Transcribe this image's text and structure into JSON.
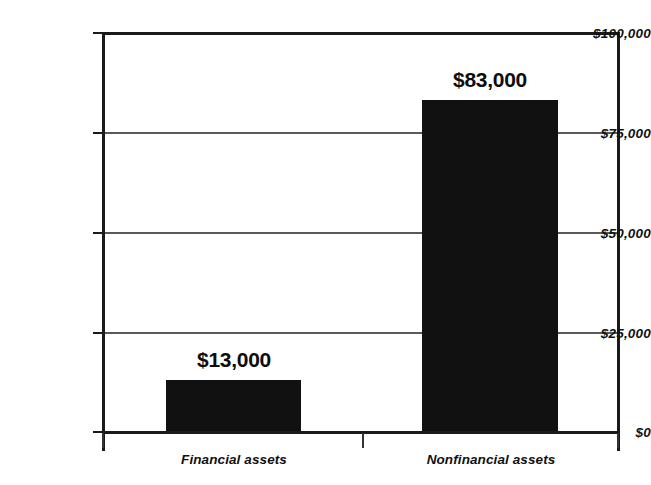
{
  "chart_data": {
    "type": "bar",
    "title": "",
    "subtitle": "",
    "xlabel": "",
    "ylabel": "",
    "categories": [
      "Financial assets",
      "Nonfinancial assets"
    ],
    "values": [
      13000,
      83000
    ],
    "value_labels": [
      "$13,000",
      "$83,000"
    ],
    "ylim": [
      0,
      100000
    ],
    "ytick_values": [
      0,
      25000,
      50000,
      75000,
      100000
    ],
    "ytick_labels": [
      "$0",
      "$25,000",
      "$50,000",
      "$75,000",
      "$100,000"
    ],
    "grid": true,
    "grid_axis": "y",
    "legend": false,
    "legend_position": "none",
    "bar_color": "#111111",
    "gridline_color": "#5a5a5a",
    "axis_color": "#1a1a1a",
    "background_color": "#ffffff",
    "annotations": []
  },
  "axis": {
    "y": {
      "ticks": [
        {
          "label": "$100,000",
          "value": 100000
        },
        {
          "label": "$75,000",
          "value": 75000
        },
        {
          "label": "$50,000",
          "value": 50000
        },
        {
          "label": "$25,000",
          "value": 25000
        },
        {
          "label": "$0",
          "value": 0
        }
      ]
    },
    "x": {
      "ticks": [
        {
          "label": "Financial assets"
        },
        {
          "label": "Nonfinancial assets"
        }
      ]
    }
  },
  "bars": [
    {
      "category": "Financial assets",
      "value": 13000,
      "label": "$13,000"
    },
    {
      "category": "Nonfinancial assets",
      "value": 83000,
      "label": "$83,000"
    }
  ]
}
